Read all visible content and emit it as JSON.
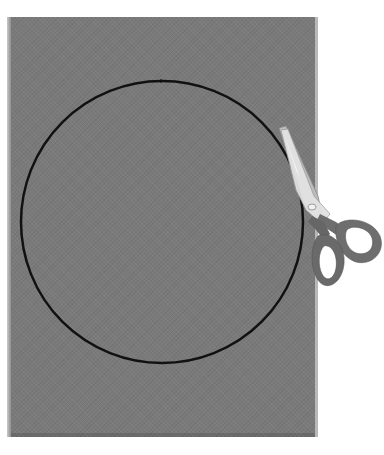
{
  "scene": {
    "description": "Gray sheet of paper with a black circle outline and a pair of scissors cutting along the circle",
    "paper": {
      "color": "#7a7a7a",
      "edge_color": "#c9c9c9"
    },
    "circle": {
      "cx": 162,
      "cy": 222,
      "r": 141,
      "stroke": "#111111",
      "stroke_width": 2.5
    },
    "scissors": {
      "blade_color": "#cfcfcf",
      "handle_color": "#6e6e6e",
      "pivot_color": "#e8e8e8"
    }
  }
}
